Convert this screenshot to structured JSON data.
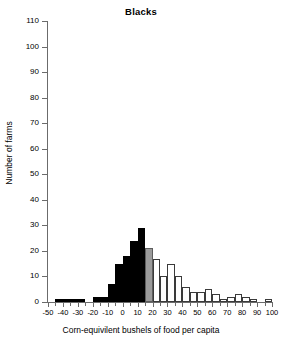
{
  "chart_data": {
    "type": "bar",
    "title": "Blacks",
    "xlabel": "Corn-equivilent bushels of food per capita",
    "ylabel": "Number of farms",
    "xlim": [
      -50,
      100
    ],
    "ylim": [
      0,
      110
    ],
    "grid": false,
    "legend": null,
    "bin_width": 5,
    "xticks": [
      -50,
      -40,
      -30,
      -20,
      -10,
      0,
      10,
      20,
      30,
      40,
      50,
      60,
      70,
      80,
      90,
      100
    ],
    "xtick_labels": [
      "-50",
      "-40",
      "-30",
      "-20",
      "-10",
      "0",
      "10",
      "20",
      "30",
      "40",
      "50",
      "60",
      "70",
      "80",
      "90",
      "100"
    ],
    "yticks": [
      0,
      10,
      20,
      30,
      40,
      50,
      60,
      70,
      80,
      90,
      100,
      110
    ],
    "ytick_labels": [
      "0",
      "10",
      "20",
      "30",
      "40",
      "50",
      "60",
      "70",
      "80",
      "90",
      "100",
      "110"
    ],
    "colors": {
      "negative_fill": "#000000",
      "transition_fill": "#9a9a9a",
      "positive_fill": "#ffffff",
      "outline": "#3a3a3a",
      "axis": "#6b6b6b"
    },
    "bins": [
      {
        "x0": -50,
        "x1": -45,
        "value": 0,
        "fill": "black"
      },
      {
        "x0": -45,
        "x1": -40,
        "value": 1,
        "fill": "black"
      },
      {
        "x0": -40,
        "x1": -35,
        "value": 1,
        "fill": "black"
      },
      {
        "x0": -35,
        "x1": -30,
        "value": 1,
        "fill": "black"
      },
      {
        "x0": -30,
        "x1": -25,
        "value": 1,
        "fill": "black"
      },
      {
        "x0": -25,
        "x1": -20,
        "value": 0,
        "fill": "black"
      },
      {
        "x0": -20,
        "x1": -15,
        "value": 2,
        "fill": "black"
      },
      {
        "x0": -15,
        "x1": -10,
        "value": 2,
        "fill": "black"
      },
      {
        "x0": -10,
        "x1": -5,
        "value": 7,
        "fill": "black"
      },
      {
        "x0": -5,
        "x1": 0,
        "value": 15,
        "fill": "black"
      },
      {
        "x0": 0,
        "x1": 5,
        "value": 18,
        "fill": "black"
      },
      {
        "x0": 5,
        "x1": 10,
        "value": 24,
        "fill": "black"
      },
      {
        "x0": 10,
        "x1": 15,
        "value": 29,
        "fill": "black"
      },
      {
        "x0": 15,
        "x1": 20,
        "value": 21,
        "fill": "gray"
      },
      {
        "x0": 20,
        "x1": 25,
        "value": 17,
        "fill": "white"
      },
      {
        "x0": 25,
        "x1": 30,
        "value": 10,
        "fill": "white"
      },
      {
        "x0": 30,
        "x1": 35,
        "value": 15,
        "fill": "white"
      },
      {
        "x0": 35,
        "x1": 40,
        "value": 10,
        "fill": "white"
      },
      {
        "x0": 40,
        "x1": 45,
        "value": 6,
        "fill": "white"
      },
      {
        "x0": 45,
        "x1": 50,
        "value": 4,
        "fill": "white"
      },
      {
        "x0": 50,
        "x1": 55,
        "value": 4,
        "fill": "white"
      },
      {
        "x0": 55,
        "x1": 60,
        "value": 5,
        "fill": "white"
      },
      {
        "x0": 60,
        "x1": 65,
        "value": 3,
        "fill": "white"
      },
      {
        "x0": 65,
        "x1": 70,
        "value": 1,
        "fill": "white"
      },
      {
        "x0": 70,
        "x1": 75,
        "value": 2,
        "fill": "white"
      },
      {
        "x0": 75,
        "x1": 80,
        "value": 3,
        "fill": "white"
      },
      {
        "x0": 80,
        "x1": 85,
        "value": 2,
        "fill": "white"
      },
      {
        "x0": 85,
        "x1": 90,
        "value": 1,
        "fill": "white"
      },
      {
        "x0": 90,
        "x1": 95,
        "value": 0,
        "fill": "white"
      },
      {
        "x0": 95,
        "x1": 100,
        "value": 1,
        "fill": "white"
      }
    ]
  }
}
